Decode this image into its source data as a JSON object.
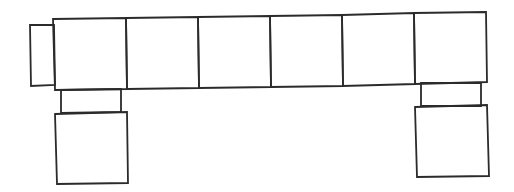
{
  "diagram": {
    "title": "",
    "stroke_color": "#2b2b2b",
    "background": "#ffffff",
    "stroke_width": 1.8,
    "shapes": [
      {
        "id": "left-tab",
        "points": [
          [
            30,
            25
          ],
          [
            54,
            25
          ],
          [
            55,
            85
          ],
          [
            31,
            86
          ]
        ]
      },
      {
        "id": "bar-cell-1",
        "points": [
          [
            53,
            19
          ],
          [
            126,
            18
          ],
          [
            127,
            89
          ],
          [
            55,
            90
          ]
        ]
      },
      {
        "id": "bar-cell-2",
        "points": [
          [
            126,
            18
          ],
          [
            198,
            17
          ],
          [
            199,
            88
          ],
          [
            127,
            89
          ]
        ]
      },
      {
        "id": "bar-cell-3",
        "points": [
          [
            198,
            17
          ],
          [
            270,
            16
          ],
          [
            271,
            87
          ],
          [
            199,
            88
          ]
        ]
      },
      {
        "id": "bar-cell-4",
        "points": [
          [
            270,
            16
          ],
          [
            342,
            15
          ],
          [
            343,
            86
          ],
          [
            271,
            87
          ]
        ]
      },
      {
        "id": "bar-cell-5",
        "points": [
          [
            342,
            15
          ],
          [
            414,
            13
          ],
          [
            415,
            84
          ],
          [
            343,
            86
          ]
        ]
      },
      {
        "id": "bar-cell-6",
        "points": [
          [
            414,
            13
          ],
          [
            486,
            12
          ],
          [
            487,
            82
          ],
          [
            415,
            84
          ]
        ]
      },
      {
        "id": "left-connector",
        "points": [
          [
            61,
            90
          ],
          [
            121,
            89
          ],
          [
            121,
            112
          ],
          [
            61,
            113
          ]
        ]
      },
      {
        "id": "left-foot",
        "points": [
          [
            55,
            114
          ],
          [
            127,
            112
          ],
          [
            128,
            183
          ],
          [
            57,
            184
          ]
        ]
      },
      {
        "id": "right-connector",
        "points": [
          [
            421,
            83
          ],
          [
            481,
            83
          ],
          [
            481,
            106
          ],
          [
            421,
            106
          ]
        ]
      },
      {
        "id": "right-foot",
        "points": [
          [
            415,
            107
          ],
          [
            487,
            105
          ],
          [
            489,
            176
          ],
          [
            417,
            177
          ]
        ]
      }
    ]
  }
}
